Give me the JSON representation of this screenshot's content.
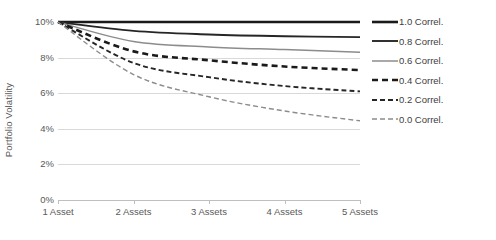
{
  "chart_data": {
    "type": "line",
    "title": "",
    "xlabel": "",
    "ylabel": "Portfolio Volatility",
    "categories": [
      "1 Asset",
      "2 Assets",
      "3 Assets",
      "4 Assets",
      "5 Assets"
    ],
    "ytick_labels": [
      "10%",
      "8%",
      "6%",
      "4%",
      "2%",
      "0%"
    ],
    "ytick_values": [
      10,
      8,
      6,
      4,
      2,
      0
    ],
    "ylim": [
      0,
      10
    ],
    "grid": true,
    "legend_position": "right",
    "series": [
      {
        "name": "1.0 Correl.",
        "values": [
          10.0,
          10.0,
          10.0,
          10.0,
          10.0
        ],
        "color": "#1a1a1a",
        "width": 2.6,
        "dash": "none"
      },
      {
        "name": "0.8 Correl.",
        "values": [
          10.0,
          9.5,
          9.3,
          9.2,
          9.15
        ],
        "color": "#262626",
        "width": 1.9,
        "dash": "none"
      },
      {
        "name": "0.6 Correl.",
        "values": [
          10.0,
          8.9,
          8.6,
          8.45,
          8.3
        ],
        "color": "#8c8c8c",
        "width": 1.5,
        "dash": "none"
      },
      {
        "name": "0.4 Correl.",
        "values": [
          10.0,
          8.35,
          7.85,
          7.5,
          7.3
        ],
        "color": "#1a1a1a",
        "width": 2.6,
        "dash": "6,4"
      },
      {
        "name": "0.2 Correl.",
        "values": [
          10.0,
          7.7,
          6.9,
          6.4,
          6.1
        ],
        "color": "#262626",
        "width": 1.9,
        "dash": "5,3"
      },
      {
        "name": "0.0 Correl.",
        "values": [
          10.0,
          7.05,
          5.8,
          5.0,
          4.45
        ],
        "color": "#8c8c8c",
        "width": 1.4,
        "dash": "5,3"
      }
    ]
  },
  "axes": {
    "y_title": "Portfolio Volatility"
  },
  "colors": {
    "gridline": "#d9d9d9",
    "axis": "#bfbfbf",
    "text": "#595959",
    "background": "#ffffff"
  }
}
